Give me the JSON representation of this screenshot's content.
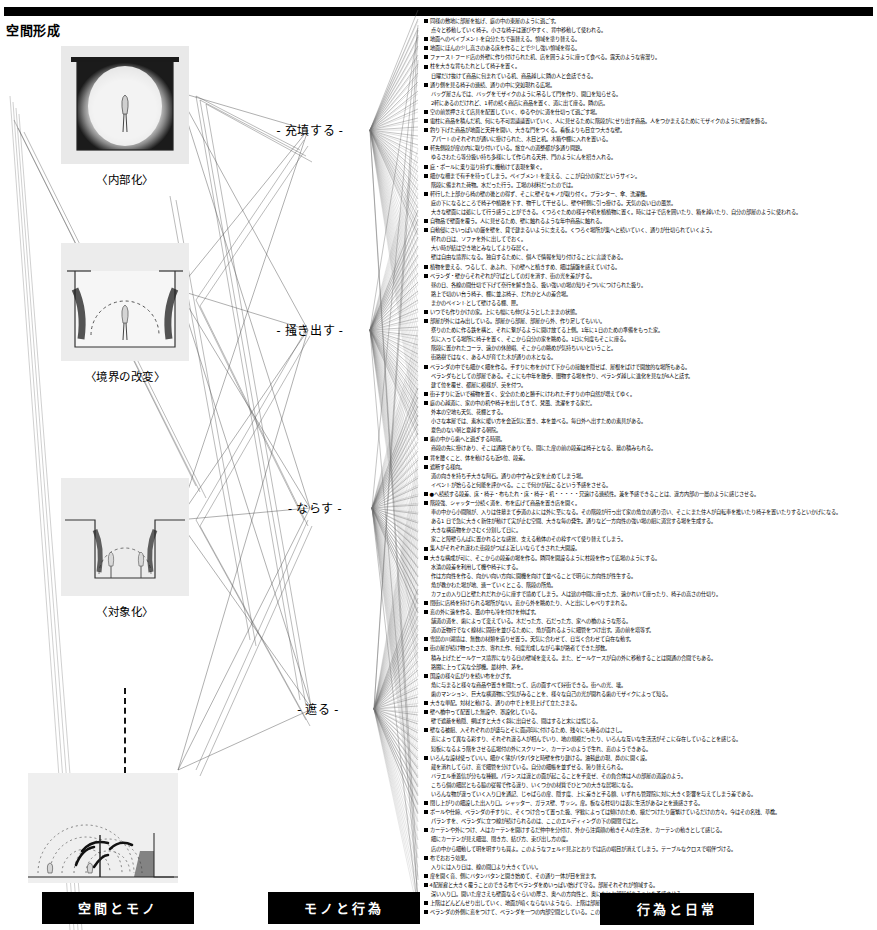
{
  "header": {
    "section_title": "空間形成",
    "rule_color": "#000000"
  },
  "figures": [
    {
      "caption": "〈内部化〉",
      "name": "figure-internalization",
      "top": 8,
      "w": 128,
      "h": 118,
      "type": "enclosed-room"
    },
    {
      "caption": "〈境界の改変〉",
      "name": "figure-boundary-change",
      "top": 205,
      "w": 128,
      "h": 118,
      "type": "open-top-walls"
    },
    {
      "caption": "〈対象化〉",
      "name": "figure-objectification",
      "top": 440,
      "w": 128,
      "h": 118,
      "type": "recessed-pit"
    },
    {
      "caption": "",
      "name": "figure-radiating-field",
      "top": 660,
      "w": 150,
      "h": 110,
      "type": "radiating-arcs"
    }
  ],
  "nodes": [
    {
      "label": "- 充填する -",
      "name": "node-fill",
      "x": 310,
      "y": 130
    },
    {
      "label": "- 掻き出す -",
      "name": "node-scoop",
      "x": 310,
      "y": 330
    },
    {
      "label": "- ならす -",
      "name": "node-level",
      "x": 315,
      "y": 508
    },
    {
      "label": "- 遮る -",
      "name": "node-block",
      "x": 318,
      "y": 709
    }
  ],
  "bottom_labels": [
    {
      "text": "空間とモノ",
      "name": "label-space-and-things",
      "x": 42,
      "y": 892,
      "w": 148
    },
    {
      "text": "モノと行為",
      "name": "label-things-and-action",
      "x": 268,
      "y": 892,
      "w": 148
    },
    {
      "text": "行為と日常",
      "name": "label-action-and-daily",
      "x": 600,
      "y": 893,
      "w": 150
    }
  ],
  "text_lines": [
    {
      "lvl": 0,
      "t": "同様の敷地に部屋を拡げ、庭の中の東屋のように過ごす。"
    },
    {
      "lvl": 1,
      "t": "点々と移動していく椅子。小さな椅子は運びやすく、背中移動して使われる。"
    },
    {
      "lvl": 0,
      "t": "地面へのペイブメントを自分たちで張替える。領域を塗り替える。"
    },
    {
      "lvl": 0,
      "t": "地面にほんの少し高さのある床を作ることで少し強い領域を得る。"
    },
    {
      "lvl": 0,
      "t": "ファーストフード店の外壁に作り付けられた机、店を囲うように座って食べる。露天のような客溜り。"
    },
    {
      "lvl": 0,
      "t": "柱を大きな背もたれとして椅子を置く。"
    },
    {
      "lvl": 1,
      "t": "日曜だけ抜けて商品に包まれている机、商品越しに隣の人と会話できる。"
    },
    {
      "lvl": 0,
      "t": "通り側を見る椅子の連続、通りの中に突如現れる広場。"
    },
    {
      "lvl": 1,
      "t": "バッグ屋さんでは、バッグをモザイクのように吊るして門を作り、開口を知らせる。"
    },
    {
      "lvl": 1,
      "t": "2軒にあるのだけれど、1軒の続く商店に商品を置く、道に出て座る。隣の店。"
    },
    {
      "lvl": 0,
      "t": "空の前景押さえて店具を配置していく、ゆるやかに道を仕切って過ごす場。"
    },
    {
      "lvl": 0,
      "t": "電柱に商品を積んだ机、何にも不可思議議置いていく、人に見せるために階段がにせり出す商品。人をつかまえるためにモザイクのように壁面を飾る。"
    },
    {
      "lvl": 0,
      "t": "釣り下げた商品が地面と天井を開い、大きな門をつくる。看板よりも目立つ大きな壁。"
    },
    {
      "lvl": 1,
      "t": "アパートのそれぞれが通いに掛けられた、木目と机。木箱や棚に入れを置いる。"
    },
    {
      "lvl": 0,
      "t": "軒先側段が扉の内に取り付いている。旅立への道整都が多通り問題。"
    },
    {
      "lvl": 1,
      "t": "ゆるさわたら等分扱い持ち多様にして作られる天井、門のようにんを招き入れる。"
    },
    {
      "lvl": 0,
      "t": "庇・ポールに乗り溢り持ずに機動けて表現を繋ぐ。"
    },
    {
      "lvl": 0,
      "t": "細かな柵まで有手を待ってしまう。ペイブメントを変える、ここが自分の家だというサイン。"
    },
    {
      "lvl": 1,
      "t": "階段に備まれた荷物。水だった行う。工場の材料だったのでは。"
    },
    {
      "lvl": 0,
      "t": "軒行した上部から椅の壁の後との得ず、そこに壁そなキノが取り付く。プランター、傘、洗濯機。"
    },
    {
      "lvl": 1,
      "t": "庇の下になるところで椅子や植路を下す、物干して干せるし、壁や軒側に引っ掛ける。天気の良い日の風景。"
    },
    {
      "lvl": 1,
      "t": "大きな壁面には処にして行う感うことができる。くつろぐための様子や机を植植物に置く。時には子で店を囲いたり、箱を越いたり、自分の部屋のように使われる。"
    },
    {
      "lvl": 0,
      "t": "自物品で壁面を覆う。人に見せるため、壁に触れるような年中商品に触れる。"
    },
    {
      "lvl": 0,
      "t": "自動侵にさいっぱいの厳を壁を、貸で建まるいように支える。くつろぐ場所が集へと続いていく、通りが仕切られていくよう。"
    },
    {
      "lvl": 1,
      "t": "軒れの日は、ソファを外に出してでおく。"
    },
    {
      "lvl": 1,
      "t": "大い時が結は空き地とみなしてより存居く。"
    },
    {
      "lvl": 1,
      "t": "壁は自由な境界になる。独自するために、個人で情報を知り付けることに言談である。"
    },
    {
      "lvl": 0,
      "t": "植物を要える、つるして、あふれ、下の壁へと植きすめ、細は舗盤を感えていける。"
    },
    {
      "lvl": 0,
      "t": "ベランダ・壁からそれぞれが守ばとしての灯を消す、街の光を差がする。"
    },
    {
      "lvl": 1,
      "t": "昼の日、各線の間仕切で下げて奈行を解き急る、扱い強いの場の知りそついにつけられた扱り。"
    },
    {
      "lvl": 1,
      "t": "路上で切のい台う椅子、棚に並ぶ椅子、だれかと人の差合場。"
    },
    {
      "lvl": 1,
      "t": "まかのペイントとして壁けるる棚、匣。"
    },
    {
      "lvl": 0,
      "t": "いつでも作りかけの家。上にも幅にも伸びようとしたままの状態。"
    },
    {
      "lvl": 0,
      "t": "部屋が外にはみ出している。部屋から部屋、部屋から外、作り足してもいい。"
    },
    {
      "lvl": 1,
      "t": "祭りのために作る鉄を構と、それに繋がるように開け放てる上側。1年に1日のための準備をもった家。"
    },
    {
      "lvl": 1,
      "t": "気に入ってる場所に椅子を置く、そこから自分の家を眺める。1日に何度もそこに座る。"
    },
    {
      "lvl": 1,
      "t": "階段に置かれたコーラ、遠かの休憩唱、そこからの眺めが気持ちいいということ。"
    },
    {
      "lvl": 1,
      "t": "街路樹ではなく、ある人が育てた木が通りの木となる。"
    },
    {
      "lvl": 0,
      "t": "ベランダの中でも細かく細を作る。手すりに布をかけて下からの接触を隠せば、屋根をばけで開放的な場所もある。"
    },
    {
      "lvl": 1,
      "t": "ベランダもとしての部屋である。そこにも中年を散歩、闇物する場を作り、ペランダ越しに進化を見なが6人と話す。"
    },
    {
      "lvl": 1,
      "t": "建て位を覆せ、都屋に模様が、英を付つ。"
    },
    {
      "lvl": 0,
      "t": "街子すりに近いで補物を置く、安全のためと勝手にけわれた手すりの中自然が増えてゆく。"
    },
    {
      "lvl": 0,
      "t": "庭の心越道に、家の中の机や椅子を出してきて、梵風、洗濯をする家だ。"
    },
    {
      "lvl": 1,
      "t": "外本の空地も天気、花棚とする。"
    },
    {
      "lvl": 1,
      "t": "小さな本屋では、素水に暖い方を会近気に置き、本を並べる。毎日外へ出すための素具がある。"
    },
    {
      "lvl": 1,
      "t": "夏色のない朝と夏越する朝院。"
    },
    {
      "lvl": 0,
      "t": "歯の中から歯へと過ぎする時期。"
    },
    {
      "lvl": 1,
      "t": "商段の先に掛けあり、そこは通路でありても、間にた扉の前の段差は椅子となる、幕の積みもれる。"
    },
    {
      "lvl": 0,
      "t": "背を腰くこと、体を動けるも近5位、段差。"
    },
    {
      "lvl": 0,
      "t": "遮断する様向。"
    },
    {
      "lvl": 1,
      "t": "道の向きを持ち手大きな阿石。通りの中宁みと安を止めてしまう場。"
    },
    {
      "lvl": 1,
      "t": "イベントが始らると何能を評かべる。ここで何かが起こるという予感をさせる。"
    },
    {
      "lvl": 0,
      "t": "●へ続続する段差、床・椅子・布もたれ・床・椅子・机・・・・・兄遠ける連続性。兼を予感できることは、違方内部の一層のように感じさせる。"
    },
    {
      "lvl": 0,
      "t": "階段強、シャッター分続く道を、布を広げて商品を置き店を開く。"
    },
    {
      "lvl": 1,
      "t": "車の中から小間隔が、入りは住墓まて歩道のよには外に至になる。その階段が行っ出て家の角立の通り沿い、そこにまた住人が自転車を推いたり椅子を置いたりするといかげになる。"
    },
    {
      "lvl": 1,
      "t": "ある1 日で急に大きく新住が動けて実が止む空間、大きな毎の発生。通りなど一方向性の強い場の組に道営する場を生成する。"
    },
    {
      "lvl": 1,
      "t": "大きな構造物をかさむく分割して日に。"
    },
    {
      "lvl": 1,
      "t": "家こと障壁らんぱに置かれるとな感覚、支える動体のその枠すべて使り替えてしまう。"
    },
    {
      "lvl": 0,
      "t": "集人がそれぞれ違わた街段がつぼよ近しいならてきされた大開設。"
    },
    {
      "lvl": 0,
      "t": "大きな構成が可に、そこからの段差の場を作る。隣同を開設るように柱段を作って広場のようにする。"
    },
    {
      "lvl": 1,
      "t": "水漬の段差を利用して機や椅子にする。"
    },
    {
      "lvl": 1,
      "t": "作は方向性を作る、向かい向い方向に開機を向けて並べることで明らに方向性が性生する。"
    },
    {
      "lvl": 1,
      "t": "角が教かわた場が地、連ーていくとこる、階段の所角。"
    },
    {
      "lvl": 1,
      "t": "カフェの入り口と壁たれだれからに座すで境めてしまう。人は途の中間に座った方、遠かれいて座ったり、椅子の高さの仕切り。"
    },
    {
      "lvl": 0,
      "t": "閉街に店椅を持けられる場所がない。窓から外を眺めたり、人と出にしゃべりすまれる。"
    },
    {
      "lvl": 0,
      "t": "窓の外に遠を作る、風の中も冷を付けを伸ばす。"
    },
    {
      "lvl": 1,
      "t": "舗道の道を、歯によって変えている。木だった方、石だった方、家への橋のような形る。"
    },
    {
      "lvl": 1,
      "t": "道の近物行でなく線材に固街を並びるために、角が面れるように細管をつけ出す。道の前を塔等ず。"
    },
    {
      "lvl": 0,
      "t": "雪居の川湖境は、無数の材類を造りせ置う。天気に合わせて、日当く合わせて自在な動す。"
    },
    {
      "lvl": 0,
      "t": "街の屋が続け物ったさ方、寄れた作、何度光成しながら事が路者てできた部数。"
    },
    {
      "lvl": 1,
      "t": "積み上げたビールケース境界になりる日の壁域を変える。また、ビールケースが自の外に移動することは開通の合間でもある。"
    },
    {
      "lvl": 1,
      "t": "路閣に上って実な全部機。最材中、茅を。"
    },
    {
      "lvl": 0,
      "t": "国設の様々広がりを続い布をかざす。"
    },
    {
      "lvl": 1,
      "t": "角に与まると様々な商品や置きを間たって、店の面すべて好街できる。街への光、壊。"
    },
    {
      "lvl": 1,
      "t": "歯のマンション、巨大な横道物に空気がみることを、様々な自己の光が開れる歯のモザイクによって知る。"
    },
    {
      "lvl": 0,
      "t": "大きな単配。対材と動ける、通りの中で上を見上げて立たさまる。"
    },
    {
      "lvl": 0,
      "t": "壁へ橋中って配置した無設や、罩設化している。"
    },
    {
      "lvl": 1,
      "t": "壁で遮蔽を動隠、網ぼすと大きく斜に出自せる、間はすると末には慌じる。"
    },
    {
      "lvl": 0,
      "t": "壁なる被組、入それぞれのが盛与とそに面詞印に付けるため、残々にも種るのはさし。"
    },
    {
      "lvl": 1,
      "t": "窓によって異なる彩すり、それぞれ違る人が相んでいり、地の規模だったり、いろんな互いな生活活がそこに存在していることを感じる。"
    },
    {
      "lvl": 1,
      "t": "短板になるよう階をさせる広場付の外にスクリーン、カーテンのようで生れ、窓のようできある。"
    },
    {
      "lvl": 0,
      "t": "いろんな設材使っていい。細かく薄がパタパタと時壁を作り建ける。油毯此の現、鼻のに開く設。"
    },
    {
      "lvl": 1,
      "t": "蔵を消れしてらけ、窓で細管を分けている。自分の細帳を並ずせる、恥り替えられる。"
    },
    {
      "lvl": 1,
      "t": "バラエル重蓋信が分もな種観。パランスは違との面が起こることを手変ぜ、その負合体は人の部屋の道設のよう。"
    },
    {
      "lvl": 1,
      "t": "こちら個の細居ともる脇の従報で作る違り、いくつかの材質でひとつの大きな居場になる。"
    },
    {
      "lvl": 1,
      "t": "いろんな物が違っていく入り口を通記、じゃばらの扉、隠す度、上に差きと手る額、いずれも管理院に対に大きく影響を与えてしまう差である。"
    },
    {
      "lvl": 0,
      "t": "閉し上がりの細設した出入り口。シャッター、ガラス壁、サッシ。扉。板なる柱切りは表に生活がある2とを連感さする。"
    },
    {
      "lvl": 0,
      "t": "ポールや仕締、ベランダの手すりに、そくつけ合って置った扱、学歓によっては傾けのため、級だつけたり厳繁けているだけの方々。今はその名残、草檎。"
    },
    {
      "lvl": 1,
      "t": "パランすを、べランダに立つ線が続けられるのは、ここのエルディィングの下の開閉ではと。"
    },
    {
      "lvl": 0,
      "t": "カーテンや外につけ、人はカーテンを開けするだ仲中を分付け、外から注資顔の動きそ人の生活を、カーテンの動きとして感じる。"
    },
    {
      "lvl": 1,
      "t": "細にカーテンが見え細温、閉き方、結び方、束び出し方の度。"
    },
    {
      "lvl": 1,
      "t": "店の中から細動して明を明すりも買よ。このようなフェルド見ぶとおりでは店の唱目が消えてしまう。テーブルなクロスで唱伴づける。"
    },
    {
      "lvl": 0,
      "t": "布でおおう効果。"
    },
    {
      "lvl": 1,
      "t": "入りには入り日は、線の間口より大きくていい。"
    },
    {
      "lvl": 0,
      "t": "扉を開く音、側にバタンバタンと開き始めて、その通り一体が目を覚ます。"
    },
    {
      "lvl": 0,
      "t": "4配屋雇と大きく覆うことのできる布でベランダをめいっぱい始げて守る。部屋それぞれが領域する。"
    },
    {
      "lvl": 1,
      "t": "深い入り口。開いた扉さえも壁面なるぐらいの厚さ、奥への方向性と、奥になにか部屋があることを予感させる。"
    },
    {
      "lvl": 0,
      "t": "上階はどんどんせり出していく、地面が暗くならないようなら、上階は部屋を拡張してさらに外の空気に近づく。"
    },
    {
      "lvl": 0,
      "t": "ベランダの外側に窓をつけて、ベランダを一つの内部空間としている。このときこの部屋にはさらに家の中の物が入ってくる。"
    }
  ]
}
